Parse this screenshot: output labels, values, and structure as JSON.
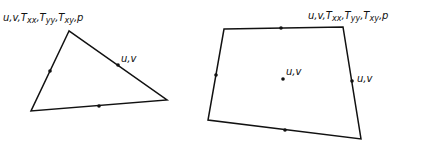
{
  "figure": {
    "elements": [
      {
        "name": "triangle-element",
        "shape": "triangle",
        "vertices": [
          [
            69,
            31
          ],
          [
            31,
            111
          ],
          [
            167,
            100
          ]
        ],
        "nodes": [
          [
            50,
            71
          ],
          [
            118,
            65
          ],
          [
            99,
            106
          ]
        ],
        "labels": {
          "corner": {
            "parts": [
              "u,v,T",
              "xx",
              ",T",
              "yy",
              ",T",
              "xy",
              ",p"
            ],
            "x": 3,
            "y": 21
          },
          "midside": {
            "text": "u,v",
            "x": 121,
            "y": 62
          }
        }
      },
      {
        "name": "quadrilateral-element",
        "shape": "quadrilateral",
        "vertices": [
          [
            224,
            29
          ],
          [
            343,
            27
          ],
          [
            361,
            139
          ],
          [
            208,
            120
          ]
        ],
        "nodes": [
          [
            281,
            28
          ],
          [
            216,
            75
          ],
          [
            352,
            81
          ],
          [
            285,
            130
          ]
        ],
        "center_node": [
          283,
          79
        ],
        "labels": {
          "corner": {
            "parts": [
              "u,v,T",
              "xx",
              ",T",
              "yy",
              ",T",
              "xy",
              ",p"
            ],
            "x": 308,
            "y": 19
          },
          "center": {
            "text": "u,v",
            "x": 286,
            "y": 75
          },
          "midside": {
            "text": "u,v",
            "x": 357,
            "y": 82
          }
        }
      }
    ],
    "stroke_color": "#111111",
    "node_color": "#111111"
  }
}
